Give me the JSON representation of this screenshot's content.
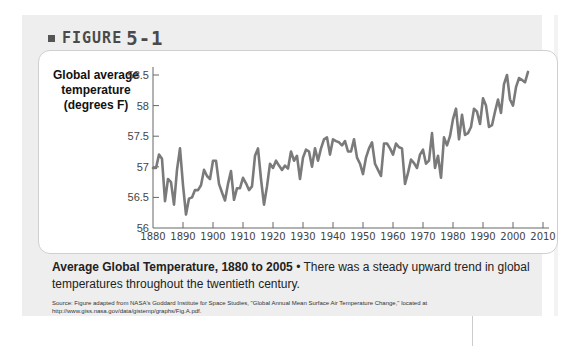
{
  "figure": {
    "label": "FIGURE",
    "number": "5-1"
  },
  "caption": {
    "title": "Average Global Temperature, 1880 to 2005",
    "bullet": "•",
    "text": "There was a steady upward trend in global temperatures throughout the twentieth century."
  },
  "source": "Source: Figure adapted from NASA's Goddard Institute for Space Studies, \"Global Annual Mean Surface Air Temperature Change,\" located at http://www.giss.nasa.gov/data/gistemp/graphs/Fig.A.pdf.",
  "chart_data": {
    "type": "line",
    "title": "Average Global Temperature, 1880 to 2005",
    "xlabel": "",
    "ylabel": "Global average temperature (degrees F)",
    "xlim": [
      1880,
      2010
    ],
    "ylim": [
      56,
      58.5
    ],
    "xticks": [
      1880,
      1890,
      1900,
      1910,
      1920,
      1930,
      1940,
      1950,
      1960,
      1970,
      1980,
      1990,
      2000,
      2010
    ],
    "yticks": [
      56,
      56.5,
      57,
      57.5,
      58,
      58.5
    ],
    "ytick_labels": [
      "56",
      "56.5",
      "57",
      "57.5",
      "58",
      "58.5"
    ],
    "grid": false,
    "legend": "none",
    "series": [
      {
        "name": "Global average temperature",
        "color": "#7a7a7a",
        "x": [
          1880,
          1881,
          1882,
          1883,
          1884,
          1885,
          1886,
          1887,
          1888,
          1889,
          1890,
          1891,
          1892,
          1893,
          1894,
          1895,
          1896,
          1897,
          1898,
          1899,
          1900,
          1901,
          1902,
          1903,
          1904,
          1905,
          1906,
          1907,
          1908,
          1909,
          1910,
          1911,
          1912,
          1913,
          1914,
          1915,
          1916,
          1917,
          1918,
          1919,
          1920,
          1921,
          1922,
          1923,
          1924,
          1925,
          1926,
          1927,
          1928,
          1929,
          1930,
          1931,
          1932,
          1933,
          1934,
          1935,
          1936,
          1937,
          1938,
          1939,
          1940,
          1941,
          1942,
          1943,
          1944,
          1945,
          1946,
          1947,
          1948,
          1949,
          1950,
          1951,
          1952,
          1953,
          1954,
          1955,
          1956,
          1957,
          1958,
          1959,
          1960,
          1961,
          1962,
          1963,
          1964,
          1965,
          1966,
          1967,
          1968,
          1969,
          1970,
          1971,
          1972,
          1973,
          1974,
          1975,
          1976,
          1977,
          1978,
          1979,
          1980,
          1981,
          1982,
          1983,
          1984,
          1985,
          1986,
          1987,
          1988,
          1989,
          1990,
          1991,
          1992,
          1993,
          1994,
          1995,
          1996,
          1997,
          1998,
          1999,
          2000,
          2001,
          2002,
          2003,
          2004,
          2005
        ],
        "values": [
          56.98,
          56.98,
          57.2,
          57.13,
          56.44,
          56.8,
          56.75,
          56.38,
          56.95,
          57.3,
          56.7,
          56.22,
          56.48,
          56.5,
          56.62,
          56.62,
          56.7,
          56.95,
          56.85,
          56.8,
          57.1,
          57.1,
          56.72,
          56.58,
          56.45,
          56.72,
          56.93,
          56.46,
          56.65,
          56.65,
          56.82,
          56.73,
          56.62,
          56.68,
          57.18,
          57.3,
          56.8,
          56.38,
          56.68,
          57.05,
          56.98,
          57.1,
          57.02,
          56.95,
          57.02,
          56.97,
          57.25,
          57.1,
          57.18,
          56.8,
          57.15,
          57.28,
          57.25,
          57.0,
          57.3,
          57.1,
          57.3,
          57.45,
          57.48,
          57.2,
          57.45,
          57.42,
          57.4,
          57.35,
          57.42,
          57.25,
          57.25,
          57.45,
          57.15,
          57.05,
          56.88,
          57.15,
          57.3,
          57.4,
          57.05,
          56.95,
          56.85,
          57.38,
          57.38,
          57.3,
          57.2,
          57.38,
          57.32,
          57.3,
          56.72,
          56.9,
          57.12,
          57.06,
          56.98,
          57.2,
          57.28,
          57.05,
          57.1,
          57.55,
          56.98,
          57.18,
          56.82,
          57.48,
          57.35,
          57.5,
          57.78,
          57.95,
          57.45,
          57.85,
          57.52,
          57.55,
          57.65,
          57.95,
          57.9,
          57.7,
          58.12,
          58.0,
          57.65,
          57.68,
          57.9,
          58.1,
          57.88,
          58.35,
          58.5,
          58.1,
          58.0,
          58.3,
          58.45,
          58.42,
          58.38,
          58.55
        ]
      }
    ]
  }
}
